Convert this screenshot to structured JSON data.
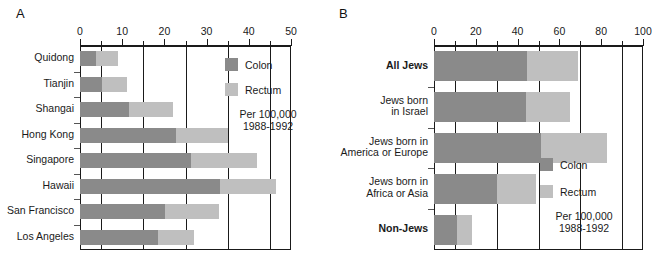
{
  "figure": {
    "panel_a_letter": "A",
    "panel_b_letter": "B"
  },
  "legend": {
    "colon_label": "Colon",
    "rectum_label": "Rectum",
    "note": "Per 100,000\n1988-1992",
    "colon_color": "#8a8a8a",
    "rectum_color": "#bfbfbf"
  },
  "chart_data": [
    {
      "type": "bar",
      "orientation": "horizontal",
      "stacked": true,
      "panel": "A",
      "title": "",
      "xlabel": "",
      "ylabel": "",
      "xlim": [
        0,
        50
      ],
      "xticks": [
        0,
        5,
        10,
        15,
        20,
        25,
        30,
        35,
        40,
        45,
        50
      ],
      "xtick_labels": [
        "0",
        "",
        "10",
        "",
        "20",
        "",
        "30",
        "",
        "40",
        "",
        "50"
      ],
      "gridlines_at": [
        5,
        15,
        25,
        35,
        45
      ],
      "grid": true,
      "legend_position": "inside-top-right",
      "categories": [
        "Quidong",
        "Tianjin",
        "Shangai",
        "Hong Kong",
        "Singapore",
        "Hawaii",
        "San Francisco",
        "Los Angeles"
      ],
      "series": [
        {
          "name": "Colon",
          "values": [
            3.8,
            5.2,
            11.6,
            22.8,
            26.2,
            33.2,
            20.2,
            18.6
          ]
        },
        {
          "name": "Rectum",
          "values": [
            5.2,
            5.9,
            10.4,
            12.2,
            15.8,
            13.3,
            12.8,
            8.4
          ]
        }
      ],
      "totals": [
        9.0,
        11.1,
        22.0,
        35.0,
        42.0,
        46.5,
        33.0,
        27.0
      ]
    },
    {
      "type": "bar",
      "orientation": "horizontal",
      "stacked": true,
      "panel": "B",
      "title": "",
      "xlabel": "",
      "ylabel": "",
      "xlim": [
        0,
        100
      ],
      "xticks": [
        0,
        10,
        20,
        30,
        40,
        50,
        60,
        70,
        80,
        90,
        100
      ],
      "xtick_labels": [
        "0",
        "",
        "20",
        "",
        "40",
        "",
        "60",
        "",
        "80",
        "",
        "100"
      ],
      "gridlines_at": [
        10,
        30,
        50,
        70,
        90
      ],
      "grid": true,
      "legend_position": "inside-bottom-right",
      "categories": [
        "All Jews",
        "Jews born\nin Israel",
        "Jews born in\nAmerica or Europe",
        "Jews born in\nAfrica or Asia",
        "Non-Jews"
      ],
      "categories_bold": [
        true,
        false,
        false,
        false,
        true
      ],
      "series": [
        {
          "name": "Colon",
          "values": [
            44.5,
            44.0,
            51.0,
            30.0,
            11.0
          ]
        },
        {
          "name": "Rectum",
          "values": [
            24.5,
            21.0,
            32.0,
            19.0,
            7.0
          ]
        }
      ],
      "totals": [
        69.0,
        65.0,
        83.0,
        49.0,
        18.0
      ]
    }
  ]
}
